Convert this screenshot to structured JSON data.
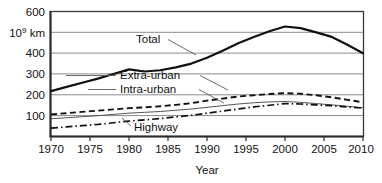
{
  "chart_data": {
    "type": "line",
    "title": "",
    "xlabel": "Year",
    "ylabel": "10⁹ km",
    "ylabel_base": "10",
    "ylabel_exp": "9",
    "ylabel_unit": " km",
    "xlim": [
      1970,
      2010
    ],
    "ylim": [
      0,
      600
    ],
    "grid": true,
    "legend_position": "inline-annotations",
    "yticks": [
      100,
      200,
      300,
      400,
      600
    ],
    "ytick_labels": [
      "100",
      "200",
      "300",
      "400",
      "600"
    ],
    "y_unit_tick": 500,
    "xticks": [
      1970,
      1975,
      1980,
      1985,
      1990,
      1995,
      2000,
      2005,
      2010
    ],
    "xtick_labels": [
      "1970",
      "1975",
      "1980",
      "1985",
      "1990",
      "1995",
      "2000",
      "2005",
      "2010"
    ],
    "x": [
      1970,
      1972,
      1974,
      1976,
      1978,
      1980,
      1982,
      1984,
      1986,
      1988,
      1990,
      1992,
      1994,
      1996,
      1998,
      2000,
      2002,
      2004,
      2006,
      2008,
      2010
    ],
    "series": [
      {
        "name": "Total",
        "style": "solid-thick",
        "values": [
          218,
          238,
          258,
          278,
          300,
          322,
          312,
          318,
          332,
          350,
          378,
          412,
          448,
          478,
          505,
          528,
          520,
          500,
          478,
          440,
          400
        ]
      },
      {
        "name": "Extra-urban",
        "style": "dashed",
        "values": [
          106,
          112,
          118,
          124,
          130,
          136,
          140,
          145,
          152,
          160,
          172,
          182,
          192,
          198,
          204,
          208,
          205,
          198,
          188,
          176,
          164
        ]
      },
      {
        "name": "Intra-urban",
        "style": "thin-solid",
        "values": [
          85,
          90,
          95,
          100,
          106,
          112,
          116,
          120,
          126,
          132,
          140,
          148,
          156,
          162,
          166,
          168,
          164,
          158,
          152,
          145,
          138
        ]
      },
      {
        "name": "Highway",
        "style": "dash-dot",
        "values": [
          40,
          46,
          52,
          58,
          66,
          74,
          80,
          86,
          94,
          102,
          112,
          122,
          132,
          142,
          150,
          158,
          156,
          152,
          148,
          142,
          136
        ]
      }
    ],
    "annotations": [
      {
        "label": "Total",
        "x_px": 136,
        "y_px": 43
      },
      {
        "label": "Extra-urban",
        "x_px": 133,
        "y_px": 79
      },
      {
        "label": "Intra-urban",
        "x_px": 133,
        "y_px": 93
      },
      {
        "label": "Highway",
        "x_px": 134,
        "y_px": 130
      }
    ]
  },
  "colors": {
    "background": "#ffffff",
    "grid": "#8b8b8b",
    "frame": "#3a3a3a",
    "total_line": "#111111",
    "extra_urban_line": "#111111",
    "intra_urban_line": "#555555",
    "highway_line": "#111111",
    "text": "#111111"
  }
}
